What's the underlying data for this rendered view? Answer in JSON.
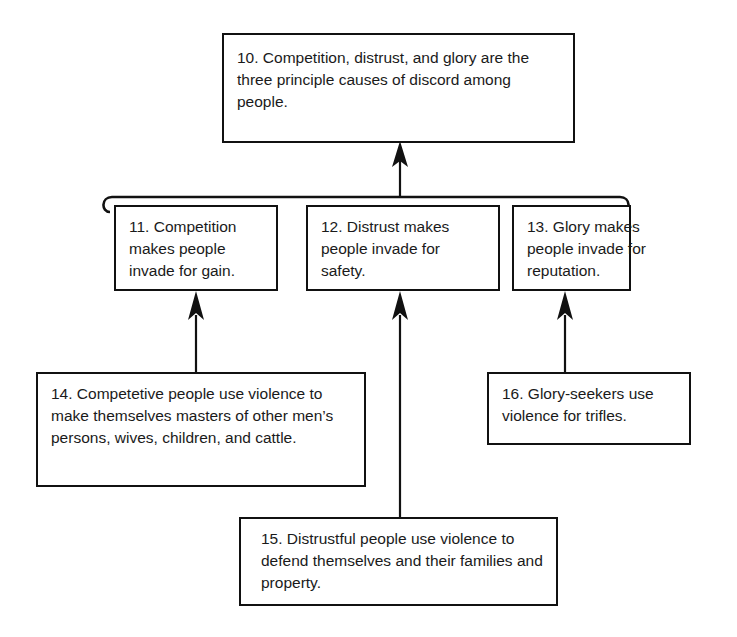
{
  "diagram": {
    "type": "argument-map",
    "background_color": "#ffffff",
    "line_color": "#111111",
    "text_color": "#1a1a1a"
  },
  "nodes": {
    "n10": {
      "id": "10",
      "text": "10. Competition, distrust, and glory are the three principle causes of discord among people.",
      "role": "main-conclusion"
    },
    "n11": {
      "id": "11",
      "text": "11. Competition makes people invade for gain.",
      "role": "premise"
    },
    "n12": {
      "id": "12",
      "text": "12. Distrust makes people invade for safety.",
      "role": "premise"
    },
    "n13": {
      "id": "13",
      "text": "13. Glory makes people invade for reputation.",
      "role": "premise"
    },
    "n14": {
      "id": "14",
      "text": "14. Competetive people use violence to make themselves masters of other men’s persons, wives, children, and cattle.",
      "role": "sub-premise"
    },
    "n15": {
      "id": "15",
      "text": "15. Distrustful people use violence to defend themselves and their families and property.",
      "role": "sub-premise"
    },
    "n16": {
      "id": "16",
      "text": "16. Glory-seekers use violence for trifles.",
      "role": "sub-premise"
    }
  },
  "edges": [
    {
      "from": "11+12+13",
      "to": "10",
      "style": "linked-bracket-arrow"
    },
    {
      "from": "14",
      "to": "11",
      "style": "arrow"
    },
    {
      "from": "15",
      "to": "12",
      "style": "arrow"
    },
    {
      "from": "16",
      "to": "13",
      "style": "arrow"
    }
  ],
  "bracket": {
    "name": "linked-premise-bracket",
    "left_x": 103,
    "right_x": 631,
    "y": 197,
    "stem_x": 400
  }
}
